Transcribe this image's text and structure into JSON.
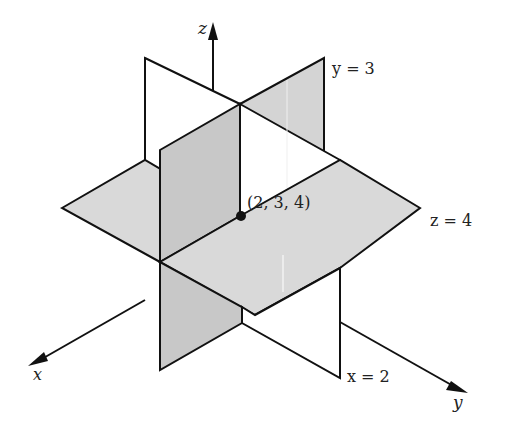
{
  "diagram": {
    "colors": {
      "background": "#ffffff",
      "stroke": "#111111",
      "plane_fill_light": "#d9d9d9",
      "plane_fill_dark": "#c6c6c6",
      "plane_fill_white": "#ffffff"
    },
    "axes": {
      "x_label": "x",
      "y_label": "y",
      "z_label": "z"
    },
    "planes": [
      {
        "id": "x2",
        "equation": "x = 2",
        "label": "x = 2"
      },
      {
        "id": "y3",
        "equation": "y = 3",
        "label": "y = 3"
      },
      {
        "id": "z4",
        "equation": "z = 4",
        "label": "z = 4"
      }
    ],
    "point": {
      "label": "(2, 3, 4)",
      "coords": [
        2,
        3,
        4
      ]
    }
  }
}
